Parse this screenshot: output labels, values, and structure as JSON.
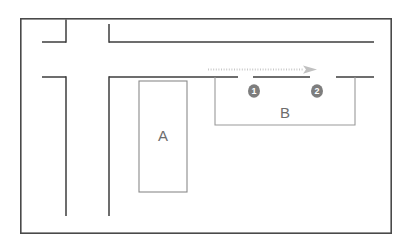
{
  "diagram": {
    "type": "street-map-schematic",
    "background_color": "#ffffff",
    "border": {
      "name": "outer-frame",
      "x": 20,
      "y": 18,
      "width": 372,
      "height": 216,
      "stroke": "#4a4a4a",
      "stroke_width": 1.6
    },
    "colors": {
      "road_line": "#3d3d3d",
      "building_line": "#8a8a8a",
      "parking_line": "#9a9a9a",
      "arrow": "#c8c8c8",
      "marker_fill": "#7d7d7d",
      "marker_text": "#ffffff",
      "label_text": "#6d6d6d"
    },
    "buildings": [
      {
        "name": "building-a",
        "label": "A",
        "x": 139,
        "y": 81,
        "width": 48,
        "height": 111,
        "label_x": 163,
        "label_y": 136
      }
    ],
    "parking_area": {
      "name": "parking-area-b",
      "label": "B",
      "x": 215,
      "y": 82,
      "width": 140,
      "height": 43,
      "label_x": 285,
      "label_y": 114,
      "open_top": true
    },
    "markers": [
      {
        "name": "marker-1",
        "number": "1",
        "glyph": "❶",
        "cx": 254,
        "cy": 91,
        "r": 6.5
      },
      {
        "name": "marker-2",
        "number": "2",
        "glyph": "❷",
        "cx": 317,
        "cy": 91,
        "r": 6.5
      }
    ],
    "direction_arrow": {
      "name": "direction-arrow",
      "style": "dotted",
      "x1": 208,
      "y1": 70,
      "x2": 306,
      "y2": 70,
      "head_x": 316,
      "head_y": 70,
      "points_to": "right"
    },
    "roads": {
      "horizontal_top": [
        {
          "name": "road-top-left-segment",
          "x1": 42,
          "y1": 42,
          "x2": 66,
          "y2": 42
        },
        {
          "name": "road-top-right-segment",
          "x1": 109,
          "y1": 42,
          "x2": 374,
          "y2": 42
        }
      ],
      "horizontal_mid": [
        {
          "name": "road-mid-segment-left",
          "x1": 42,
          "y1": 77,
          "x2": 66,
          "y2": 77
        },
        {
          "name": "road-mid-segment-a",
          "x1": 109,
          "y1": 77,
          "x2": 238,
          "y2": 77
        },
        {
          "name": "road-mid-segment-b",
          "x1": 253,
          "y1": 77,
          "x2": 310,
          "y2": 77
        },
        {
          "name": "road-mid-segment-c",
          "x1": 336,
          "y1": 77,
          "x2": 374,
          "y2": 77
        }
      ],
      "vertical": [
        {
          "name": "road-vertical-upper-stub",
          "x1": 66,
          "y1": 18,
          "x2": 66,
          "y2": 42
        },
        {
          "name": "road-vertical-left",
          "x1": 66,
          "y1": 77,
          "x2": 66,
          "y2": 216
        },
        {
          "name": "road-vertical-mid-upper",
          "x1": 109,
          "y1": 24,
          "x2": 109,
          "y2": 42
        },
        {
          "name": "road-vertical-mid",
          "x1": 109,
          "y1": 77,
          "x2": 109,
          "y2": 216
        }
      ]
    },
    "labels": {
      "building_a": "A",
      "parking_b": "B",
      "marker_one": "1",
      "marker_two": "2"
    }
  }
}
